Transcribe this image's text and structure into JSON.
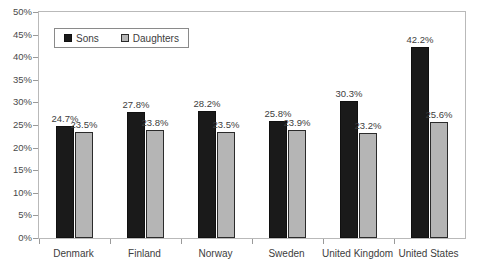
{
  "chart_data": {
    "type": "bar",
    "title": "",
    "xlabel": "",
    "ylabel": "",
    "ylim": [
      0,
      50
    ],
    "ytick_labels": [
      "0%",
      "5%",
      "10%",
      "15%",
      "20%",
      "25%",
      "30%",
      "35%",
      "40%",
      "45%",
      "50%"
    ],
    "ytick_values": [
      0,
      5,
      10,
      15,
      20,
      25,
      30,
      35,
      40,
      45,
      50
    ],
    "grid": false,
    "legend_position": "top-left",
    "categories": [
      "Denmark",
      "Finland",
      "Norway",
      "Sweden",
      "United Kingdom",
      "United States"
    ],
    "series": [
      {
        "name": "Sons",
        "color": "#1a1a1a",
        "values": [
          24.7,
          27.8,
          28.2,
          25.8,
          30.3,
          42.2
        ],
        "labels": [
          "24.7%",
          "27.8%",
          "28.2%",
          "25.8%",
          "30.3%",
          "42.2%"
        ]
      },
      {
        "name": "Daughters",
        "color": "#b5b5b5",
        "values": [
          23.5,
          23.8,
          23.5,
          23.9,
          23.2,
          25.6
        ],
        "labels": [
          "23.5%",
          "23.8%",
          "23.5%",
          "23.9%",
          "23.2%",
          "25.6%"
        ]
      }
    ]
  },
  "legend": {
    "entries": [
      {
        "label": "Sons",
        "swatch": "sons"
      },
      {
        "label": "Daughters",
        "swatch": "daughters"
      }
    ]
  },
  "colors": {
    "sons": "#1a1a1a",
    "daughters": "#b5b5b5",
    "axis": "#9a9a9a",
    "frame": "#b9b9b9",
    "text": "#3d3d3d"
  }
}
